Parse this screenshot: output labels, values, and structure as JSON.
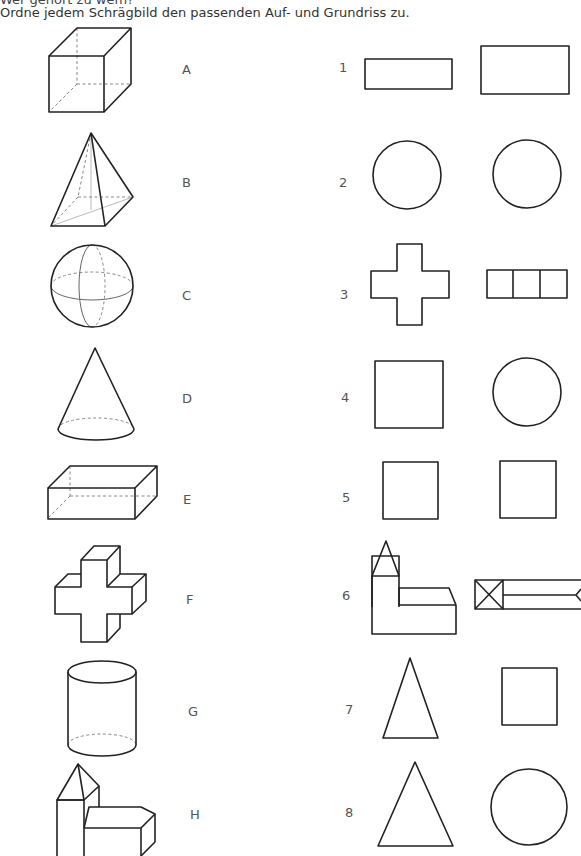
{
  "header": {
    "title": "Wer gehört zu wem?",
    "instruction": "Ordne jedem Schrägbild den passenden Auf- und Grundriss zu."
  },
  "solids": [
    {
      "letter": "A",
      "shape": "cube"
    },
    {
      "letter": "B",
      "shape": "square-pyramid"
    },
    {
      "letter": "C",
      "shape": "sphere"
    },
    {
      "letter": "D",
      "shape": "cone"
    },
    {
      "letter": "E",
      "shape": "cuboid"
    },
    {
      "letter": "F",
      "shape": "cross-prism"
    },
    {
      "letter": "G",
      "shape": "cylinder"
    },
    {
      "letter": "H",
      "shape": "church-building"
    }
  ],
  "views": [
    {
      "number": "1",
      "elevation": "wide-rectangle",
      "plan": "rectangle"
    },
    {
      "number": "2",
      "elevation": "circle",
      "plan": "circle"
    },
    {
      "number": "3",
      "elevation": "cross",
      "plan": "three-squares-row"
    },
    {
      "number": "4",
      "elevation": "square",
      "plan": "circle"
    },
    {
      "number": "5",
      "elevation": "square",
      "plan": "square"
    },
    {
      "number": "6",
      "elevation": "church-front",
      "plan": "church-top"
    },
    {
      "number": "7",
      "elevation": "triangle",
      "plan": "square"
    },
    {
      "number": "8",
      "elevation": "triangle",
      "plan": "circle"
    }
  ]
}
